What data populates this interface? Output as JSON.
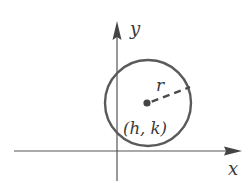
{
  "diagram": {
    "axes": {
      "x_label": "x",
      "y_label": "y"
    },
    "circle": {
      "center_label": "(h, k)",
      "radius_label": "r"
    },
    "colors": {
      "axis": "#555555",
      "circle": "#5a5a5a",
      "text": "#3a3a3a",
      "background": "#ffffff"
    }
  }
}
